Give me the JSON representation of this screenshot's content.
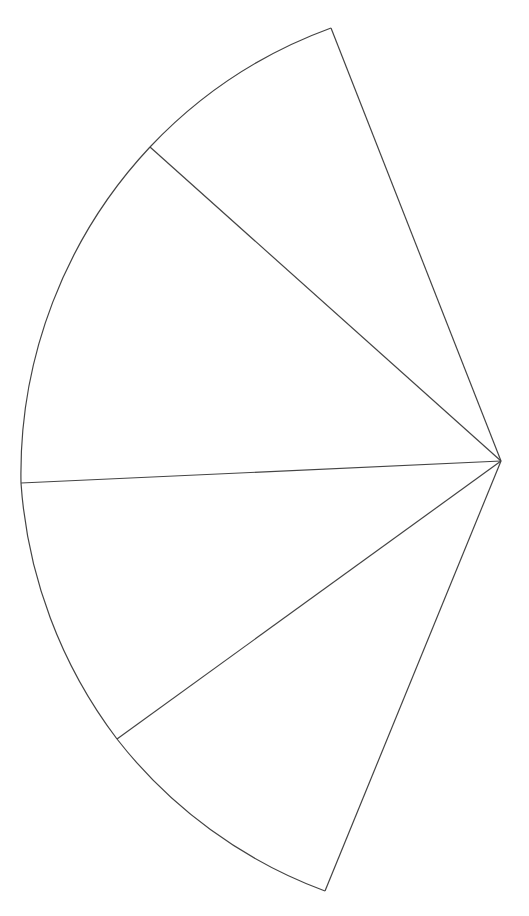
{
  "diagram": {
    "type": "fan-sector",
    "stroke_color": "#444444",
    "background": "#ffffff",
    "apex": [
      501,
      461
    ],
    "sectors": [
      {
        "id": 1,
        "from": [
          331,
          28
        ],
        "to": [
          150,
          147
        ],
        "r": 470
      },
      {
        "id": 2,
        "from": [
          150,
          147
        ],
        "to": [
          21,
          483
        ],
        "r": 478
      },
      {
        "id": 3,
        "from": [
          21,
          483
        ],
        "to": [
          117,
          739
        ],
        "r": 478
      },
      {
        "id": 4,
        "from": [
          117,
          739
        ],
        "to": [
          325,
          891
        ],
        "r": 470
      }
    ]
  }
}
